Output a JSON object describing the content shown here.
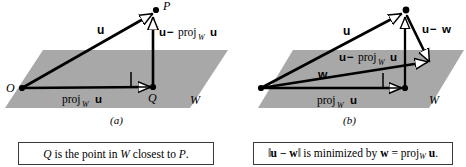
{
  "figure": {
    "background_color": "#ffffff",
    "plane_fill": "#a8a8a8",
    "stroke_color": "#000000"
  },
  "panels": [
    {
      "id": "a",
      "panel_label": "(a)",
      "plane_label": "W",
      "points": [
        {
          "name": "O",
          "label": "O"
        },
        {
          "name": "P",
          "label": "P"
        },
        {
          "name": "Q",
          "label": "Q"
        }
      ],
      "vector_labels": [
        {
          "name": "u",
          "text": "u"
        },
        {
          "name": "u-minus-proj",
          "text": "u − proj",
          "sub": "W",
          "tail": "u"
        },
        {
          "name": "proj",
          "text": "proj",
          "sub": "W",
          "tail": "u"
        }
      ],
      "caption": {
        "parts": [
          {
            "text": "Q",
            "style": "italic"
          },
          {
            "text": " is the point in ",
            "style": "normal"
          },
          {
            "text": "W",
            "style": "italic"
          },
          {
            "text": " closest to ",
            "style": "normal"
          },
          {
            "text": "P",
            "style": "italic"
          },
          {
            "text": ".",
            "style": "normal"
          }
        ]
      }
    },
    {
      "id": "b",
      "panel_label": "(b)",
      "plane_label": "W",
      "points": [],
      "vector_labels": [
        {
          "name": "u",
          "text": "u"
        },
        {
          "name": "u-minus-w",
          "text": "u − w"
        },
        {
          "name": "u-minus-proj",
          "text": "u − proj",
          "sub": "W",
          "tail": "u"
        },
        {
          "name": "w",
          "text": "w"
        },
        {
          "name": "proj",
          "text": "proj",
          "sub": "W",
          "tail": "u"
        }
      ],
      "caption": {
        "parts": [
          {
            "text": "‖",
            "style": "bar"
          },
          {
            "text": "u − w",
            "style": "bold"
          },
          {
            "text": "‖",
            "style": "bar"
          },
          {
            "text": " is minimized by ",
            "style": "normal"
          },
          {
            "text": "w",
            "style": "bold"
          },
          {
            "text": " = proj",
            "style": "normal"
          },
          {
            "text": "W",
            "style": "sub"
          },
          {
            "text": " u",
            "style": "bold"
          },
          {
            "text": ".",
            "style": "normal"
          }
        ]
      }
    }
  ],
  "text": {
    "panel_a_label": "(a)",
    "panel_b_label": "(b)",
    "plane_W": "W",
    "point_O": "O",
    "point_P": "P",
    "point_Q": "Q",
    "vec_u": "u",
    "vec_w": "w",
    "proj_word": "proj",
    "sub_W": "W",
    "minus": "−",
    "caption_a": "Q is the point in W closest to P.",
    "caption_b": "‖u − w‖ is minimized by w = proj_W u."
  }
}
